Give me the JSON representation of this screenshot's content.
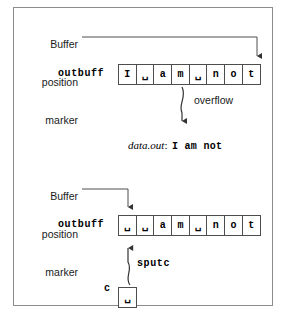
{
  "figure": {
    "blank_glyph": "␣",
    "line_color": "#4d4d4d",
    "frame_color": "#8c8c8c",
    "text_color": "#1a1a1a"
  },
  "top_panel": {
    "marker_label": {
      "line1": "Buffer",
      "line2": "position",
      "line3": "marker"
    },
    "buffer_name": "outbuff",
    "cells": [
      "I",
      "␣",
      "a",
      "m",
      "␣",
      "n",
      "o",
      "t"
    ],
    "overflow_label": "overflow",
    "output": {
      "stream_name": "data.out",
      "separator": ":",
      "value": "I am not"
    }
  },
  "bottom_panel": {
    "marker_label": {
      "line1": "Buffer",
      "line2": "position",
      "line3": "marker"
    },
    "buffer_name": "outbuff",
    "cells": [
      "␣",
      "␣",
      "a",
      "m",
      "␣",
      "n",
      "o",
      "t"
    ],
    "operation_label": "sputc",
    "char_var_label": "c",
    "char_var_value": "␣"
  }
}
